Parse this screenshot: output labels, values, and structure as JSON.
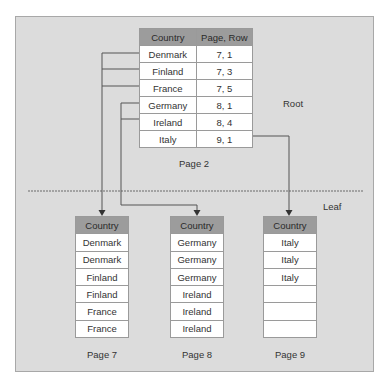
{
  "root_table": {
    "headers": [
      "Country",
      "Page, Row"
    ],
    "rows": [
      [
        "Denmark",
        "7, 1"
      ],
      [
        "Finland",
        "7, 3"
      ],
      [
        "France",
        "7, 5"
      ],
      [
        "Germany",
        "8, 1"
      ],
      [
        "Ireland",
        "8, 4"
      ],
      [
        "Italy",
        "9, 1"
      ]
    ],
    "caption": "Page 2",
    "level_label": "Root"
  },
  "leaf_level_label": "Leaf",
  "leaf_tables": [
    {
      "header": "Country",
      "rows": [
        "Denmark",
        "Denmark",
        "Finland",
        "Finland",
        "France",
        "France"
      ],
      "caption": "Page 7"
    },
    {
      "header": "Country",
      "rows": [
        "Germany",
        "Germany",
        "Germany",
        "Ireland",
        "Ireland",
        "Ireland"
      ],
      "caption": "Page 8"
    },
    {
      "header": "Country",
      "rows": [
        "Italy",
        "Italy",
        "Italy",
        "",
        "",
        ""
      ],
      "caption": "Page 9"
    }
  ],
  "colors": {
    "panel_bg": "#dcdcdc",
    "header_bg": "#9c9c9c",
    "line": "#555555"
  }
}
